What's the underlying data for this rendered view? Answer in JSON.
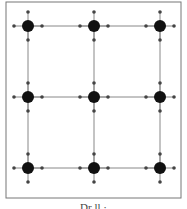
{
  "diagram": {
    "type": "grid-graph",
    "rows": 3,
    "cols": 3,
    "frame": {
      "x": 6,
      "y": 2,
      "w": 175,
      "h": 196,
      "stroke": "#777777"
    },
    "node_xs": [
      28,
      94,
      160
    ],
    "node_ys": [
      26,
      97,
      168
    ],
    "node_radius": 6,
    "port_radius": 1.8,
    "port_offset": 14,
    "colors": {
      "node": "#111111",
      "port": "#444444",
      "edge": "#888888"
    }
  },
  "caption": {
    "text": "Dr     ll                    ·"
  }
}
